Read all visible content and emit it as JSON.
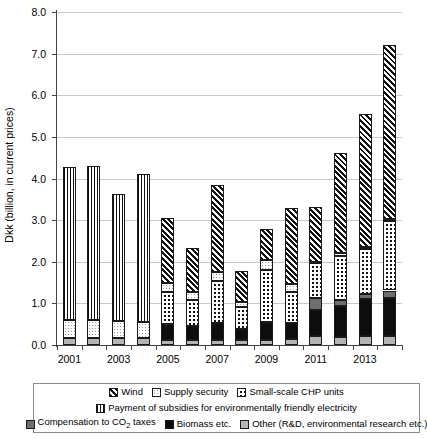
{
  "chart_data": {
    "type": "bar",
    "stacked": true,
    "title": "",
    "xlabel": "",
    "ylabel": "Dkk (billion, in current prices)",
    "ylim": [
      0.0,
      8.0
    ],
    "ytick_labels": [
      "0.0",
      "1.0",
      "2.0",
      "3.0",
      "4.0",
      "5.0",
      "6.0",
      "7.0",
      "8.0"
    ],
    "ytick_values": [
      0.0,
      1.0,
      2.0,
      3.0,
      4.0,
      5.0,
      6.0,
      7.0,
      8.0
    ],
    "grid": true,
    "legend_position": "bottom",
    "categories": [
      "2001",
      "2002",
      "2003",
      "2004",
      "2005",
      "2006",
      "2007",
      "2008",
      "2009",
      "2010",
      "2011",
      "2012",
      "2013",
      "2014"
    ],
    "tick_labels_shown": [
      "2001",
      "",
      "2003",
      "",
      "2005",
      "",
      "2007",
      "",
      "2009",
      "",
      "2011",
      "",
      "2013",
      ""
    ],
    "series": [
      {
        "name": "Other (R&D, environmental research etc.)",
        "key": "other",
        "pattern": "solid-light-gray",
        "color": "#b4b4b4",
        "values": [
          0.18,
          0.18,
          0.17,
          0.17,
          0.13,
          0.13,
          0.13,
          0.12,
          0.13,
          0.14,
          0.22,
          0.2,
          0.21,
          0.21
        ]
      },
      {
        "name": "Biomass etc.",
        "key": "biomass",
        "pattern": "solid-black",
        "color": "#0d0d0d",
        "values": [
          0.0,
          0.0,
          0.0,
          0.0,
          0.37,
          0.32,
          0.41,
          0.26,
          0.43,
          0.4,
          0.63,
          0.74,
          0.89,
          0.93
        ]
      },
      {
        "name": "Compensation to CO2 taxes",
        "key": "co2",
        "pattern": "solid-dark-gray",
        "color": "#6e6e6e",
        "values": [
          0.0,
          0.0,
          0.0,
          0.0,
          0.0,
          0.0,
          0.0,
          0.0,
          0.0,
          0.0,
          0.27,
          0.13,
          0.12,
          0.17
        ]
      },
      {
        "name": "Small-scale CHP units",
        "key": "chp",
        "pattern": "dots",
        "color": "#ffffff",
        "values": [
          0.0,
          0.0,
          0.0,
          0.0,
          0.78,
          0.62,
          1.0,
          0.54,
          1.25,
          0.73,
          0.84,
          1.08,
          1.09,
          1.66
        ]
      },
      {
        "name": "Supply security",
        "key": "supply",
        "pattern": "fine-dots",
        "color": "#ffffff",
        "values": [
          0.42,
          0.43,
          0.4,
          0.38,
          0.22,
          0.2,
          0.22,
          0.11,
          0.23,
          0.19,
          0.04,
          0.05,
          0.05,
          0.05
        ]
      },
      {
        "name": "Payment of subsidies for environmentally friendly electricity",
        "key": "subsidy",
        "pattern": "vertical-stripes",
        "color": "#ffffff",
        "values": [
          3.68,
          3.68,
          3.06,
          3.56,
          0.0,
          0.0,
          0.0,
          0.0,
          0.0,
          0.0,
          0.0,
          0.0,
          0.0,
          0.0
        ]
      },
      {
        "name": "Wind",
        "key": "wind",
        "pattern": "diagonal-hatch",
        "color": "#ffffff",
        "values": [
          0.0,
          0.0,
          0.0,
          0.0,
          1.55,
          1.05,
          2.09,
          0.75,
          0.74,
          1.82,
          1.32,
          2.42,
          3.19,
          4.18
        ]
      }
    ],
    "totals": [
      4.28,
      4.29,
      3.63,
      4.23,
      3.05,
      2.32,
      3.85,
      1.78,
      2.78,
      3.28,
      3.32,
      4.62,
      5.55,
      7.2
    ]
  },
  "legend": {
    "rows": [
      [
        {
          "label": "Wind",
          "key": "wind"
        },
        {
          "label": "Supply security",
          "key": "supply"
        },
        {
          "label": "Small-scale CHP units",
          "key": "chp"
        }
      ],
      [
        {
          "label": "Payment of subsidies for environmentally friendly electricity",
          "key": "subsidy"
        }
      ],
      [
        {
          "label_pre": "Compensation to CO",
          "label_sub": "2",
          "label_post": " taxes",
          "key": "co2"
        },
        {
          "label": "Biomass etc.",
          "key": "biomass"
        },
        {
          "label": "Other (R&D, environmental research etc.)",
          "key": "other"
        }
      ]
    ]
  }
}
